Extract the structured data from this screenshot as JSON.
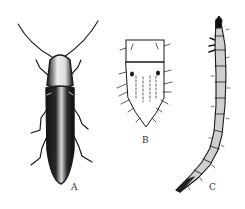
{
  "figure": {
    "panels": [
      {
        "id": "A",
        "label": "A",
        "subject": "adult click beetle, dorsal view"
      },
      {
        "id": "B",
        "label": "B",
        "subject": "larval terminal segment, dorsal view"
      },
      {
        "id": "C",
        "label": "C",
        "subject": "wireworm larva, lateral view"
      }
    ],
    "colors": {
      "ink": "#1a1a1a",
      "paper": "#ffffff",
      "label": "#333333"
    }
  }
}
